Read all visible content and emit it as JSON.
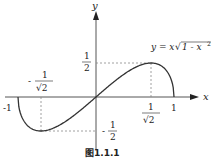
{
  "figure": {
    "caption": "图1.1.1",
    "function_label": "y = x√1 - x²",
    "function_label_parts": {
      "lhs": "y = x",
      "radicand": "1 - x",
      "exp": "2"
    },
    "axes": {
      "x_label": "x",
      "y_label": "y"
    },
    "ticks": {
      "x_neg_one": "-1",
      "x_one": "1",
      "x_pos_frac": {
        "num": "1",
        "den": "√2"
      },
      "x_neg_frac": {
        "sign": "-",
        "num": "1",
        "den": "√2"
      },
      "y_pos_half": {
        "num": "1",
        "den": "2"
      },
      "y_neg_half": {
        "sign": "-",
        "num": "1",
        "den": "2"
      }
    },
    "colors": {
      "curve": "#333333",
      "axis": "#555555",
      "guide": "#888888"
    }
  },
  "chart_data": {
    "type": "line",
    "xlabel": "x",
    "ylabel": "y",
    "xlim": [
      -1,
      1
    ],
    "ylim": [
      -0.5,
      0.5
    ],
    "key_points": [
      {
        "x": -1,
        "y": 0
      },
      {
        "x": -0.7071,
        "y": -0.5
      },
      {
        "x": 0,
        "y": 0
      },
      {
        "x": 0.7071,
        "y": 0.5
      },
      {
        "x": 1,
        "y": 0
      }
    ],
    "annotations": [
      "1/2",
      "-1/2",
      "1/√2",
      "-1/√2",
      "-1",
      "1"
    ]
  }
}
